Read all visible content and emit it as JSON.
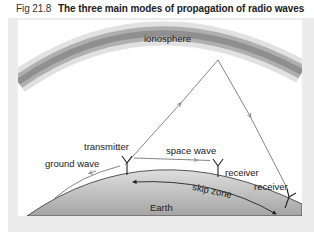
{
  "figure": {
    "number": "Fig 21.8",
    "title": "The three main modes of propagation of radio waves"
  },
  "diagram": {
    "labels": {
      "ionosphere": "ionosphere",
      "transmitter": "transmitter",
      "ground_wave": "ground wave",
      "space_wave": "space wave",
      "receiver_1": "receiver",
      "receiver_2": "receiver",
      "skip_zone": "skip zone",
      "earth": "Earth"
    },
    "colors": {
      "ionosphere_band": "#8a8a8a",
      "earth_fill_top": "#d6d6d6",
      "earth_fill_bottom": "#a9a9a9",
      "line": "#555555",
      "frame": "#ececec"
    }
  }
}
